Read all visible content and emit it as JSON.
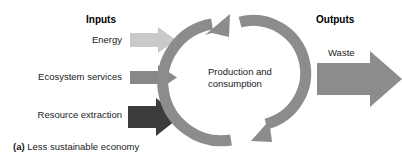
{
  "figure": {
    "caption_index": "(a)",
    "caption_text": "Less sustainable economy"
  },
  "inputs": {
    "heading": "Inputs",
    "items": [
      {
        "label": "Energy",
        "arrow": "arrow-right-icon",
        "color": "#c9c9c9",
        "size": "small"
      },
      {
        "label": "Ecosystem services",
        "arrow": "arrow-right-icon",
        "color": "#888888",
        "size": "medium"
      },
      {
        "label": "Resource extraction",
        "arrow": "arrow-right-icon",
        "color": "#3c3c3c",
        "size": "large"
      }
    ]
  },
  "process": {
    "label_line1": "Production and",
    "label_line2": "consumption",
    "cycle_icon": "circular-arrows-icon",
    "color": "#8c8c8c"
  },
  "outputs": {
    "heading": "Outputs",
    "items": [
      {
        "label": "Waste",
        "arrow": "arrow-right-icon",
        "color": "#8c8c8c",
        "size": "large"
      }
    ]
  },
  "colors": {
    "background": "#ffffff",
    "text": "#1a1a1a",
    "energy_arrow": "#c9c9c9",
    "ecosystem_arrow": "#888888",
    "resource_arrow": "#3c3c3c",
    "cycle_arrow": "#8c8c8c",
    "waste_arrow": "#8c8c8c"
  }
}
